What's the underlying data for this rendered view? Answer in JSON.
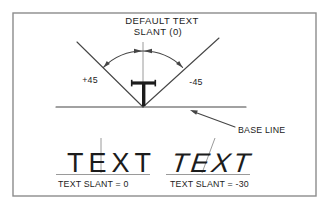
{
  "diagram": {
    "title_line1": "DEFAULT TEXT",
    "title_line2": "SLANT (0)",
    "angle_left_label": "+45",
    "angle_right_label": "-45",
    "baseline_label": "BASE LINE",
    "samples": {
      "left": {
        "text": "TEXT",
        "caption": "TEXT SLANT = 0",
        "slant_value": 0
      },
      "right": {
        "text": "TEXT",
        "caption": "TEXT SLANT = -30",
        "slant_value": -30
      }
    },
    "colors": {
      "background": "#ffffff",
      "border": "#8c8c8c",
      "line": "#454545",
      "rule": "#8f8f8f",
      "text": "#1c1c1c"
    }
  }
}
